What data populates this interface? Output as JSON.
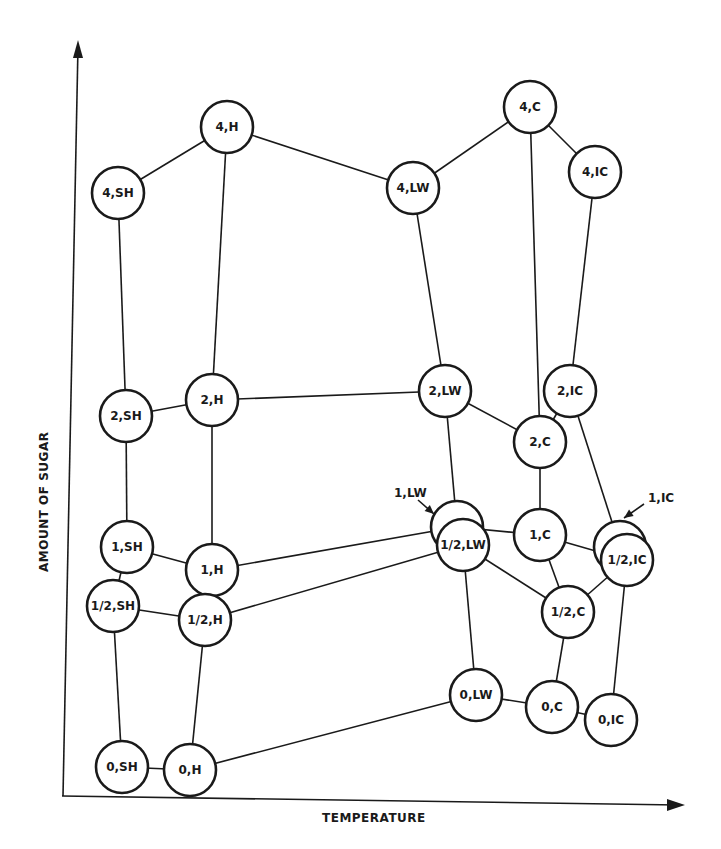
{
  "diagram": {
    "axes": {
      "x_label": "TEMPERATURE",
      "y_label": "AMOUNT OF SUGAR"
    },
    "node_radius": 26,
    "nodes": [
      {
        "id": "4_SH",
        "label": "4,SH",
        "x": 118,
        "y": 193
      },
      {
        "id": "4_H",
        "label": "4,H",
        "x": 227,
        "y": 127
      },
      {
        "id": "4_LW",
        "label": "4,LW",
        "x": 413,
        "y": 188
      },
      {
        "id": "4_C",
        "label": "4,C",
        "x": 530,
        "y": 107
      },
      {
        "id": "4_IC",
        "label": "4,IC",
        "x": 595,
        "y": 172
      },
      {
        "id": "2_SH",
        "label": "2,SH",
        "x": 126,
        "y": 416
      },
      {
        "id": "2_H",
        "label": "2,H",
        "x": 212,
        "y": 400
      },
      {
        "id": "2_LW",
        "label": "2,LW",
        "x": 445,
        "y": 391
      },
      {
        "id": "2_C",
        "label": "2,C",
        "x": 540,
        "y": 442
      },
      {
        "id": "2_IC",
        "label": "2,IC",
        "x": 570,
        "y": 391
      },
      {
        "id": "1_SH",
        "label": "1,SH",
        "x": 127,
        "y": 547
      },
      {
        "id": "1_H",
        "label": "1,H",
        "x": 212,
        "y": 570
      },
      {
        "id": "1_LW",
        "label": "",
        "x": 457,
        "y": 527
      },
      {
        "id": "1_C",
        "label": "1,C",
        "x": 540,
        "y": 535
      },
      {
        "id": "1_IC",
        "label": "",
        "x": 620,
        "y": 547
      },
      {
        "id": "h_SH",
        "label": "1/2,SH",
        "x": 113,
        "y": 606
      },
      {
        "id": "h_H",
        "label": "1/2,H",
        "x": 205,
        "y": 620
      },
      {
        "id": "h_LW",
        "label": "1/2,LW",
        "x": 463,
        "y": 545
      },
      {
        "id": "h_C",
        "label": "1/2,C",
        "x": 568,
        "y": 612
      },
      {
        "id": "h_IC",
        "label": "1/2,IC",
        "x": 627,
        "y": 560
      },
      {
        "id": "0_SH",
        "label": "0,SH",
        "x": 122,
        "y": 767
      },
      {
        "id": "0_H",
        "label": "0,H",
        "x": 190,
        "y": 770
      },
      {
        "id": "0_LW",
        "label": "0,LW",
        "x": 476,
        "y": 695
      },
      {
        "id": "0_C",
        "label": "0,C",
        "x": 552,
        "y": 707
      },
      {
        "id": "0_IC",
        "label": "0,IC",
        "x": 611,
        "y": 720
      }
    ],
    "edges": [
      [
        "4_SH",
        "4_H"
      ],
      [
        "4_H",
        "4_LW"
      ],
      [
        "4_LW",
        "4_C"
      ],
      [
        "4_C",
        "4_IC"
      ],
      [
        "4_SH",
        "2_SH"
      ],
      [
        "4_H",
        "2_H"
      ],
      [
        "4_LW",
        "2_LW"
      ],
      [
        "4_C",
        "2_C"
      ],
      [
        "4_IC",
        "2_IC"
      ],
      [
        "2_SH",
        "2_H"
      ],
      [
        "2_H",
        "2_LW"
      ],
      [
        "2_LW",
        "2_C"
      ],
      [
        "2_C",
        "2_IC"
      ],
      [
        "2_SH",
        "1_SH"
      ],
      [
        "2_H",
        "1_H"
      ],
      [
        "2_LW",
        "1_LW"
      ],
      [
        "2_C",
        "1_C"
      ],
      [
        "2_IC",
        "1_IC"
      ],
      [
        "1_SH",
        "1_H"
      ],
      [
        "1_H",
        "1_LW"
      ],
      [
        "1_LW",
        "1_C"
      ],
      [
        "1_C",
        "h_IC"
      ],
      [
        "1_SH",
        "h_SH"
      ],
      [
        "1_H",
        "h_H"
      ],
      [
        "1_C",
        "h_C"
      ],
      [
        "h_SH",
        "h_H"
      ],
      [
        "h_H",
        "h_LW"
      ],
      [
        "h_LW",
        "h_C"
      ],
      [
        "h_C",
        "h_IC"
      ],
      [
        "h_SH",
        "0_SH"
      ],
      [
        "h_H",
        "0_H"
      ],
      [
        "h_LW",
        "0_LW"
      ],
      [
        "h_C",
        "0_C"
      ],
      [
        "h_IC",
        "0_IC"
      ],
      [
        "0_SH",
        "0_H"
      ],
      [
        "0_H",
        "0_LW"
      ],
      [
        "0_LW",
        "0_C"
      ],
      [
        "0_C",
        "0_IC"
      ]
    ],
    "callouts": [
      {
        "label": "1,LW",
        "text_x": 394,
        "text_y": 497,
        "from_x": 418,
        "from_y": 500,
        "to_x": 434,
        "to_y": 514
      },
      {
        "label": "1,IC",
        "text_x": 648,
        "text_y": 502,
        "from_x": 644,
        "from_y": 504,
        "to_x": 624,
        "to_y": 518
      }
    ]
  }
}
